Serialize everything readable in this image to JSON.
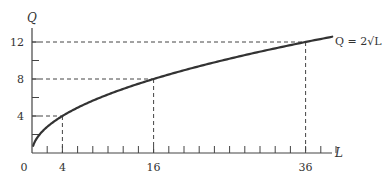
{
  "chart_data": {
    "type": "line",
    "title": "",
    "xlabel": "L",
    "ylabel": "Q",
    "series": [
      {
        "name": "Q = 2√L",
        "function": "Q = 2*sqrt(L)",
        "x": [
          0,
          1,
          2,
          4,
          8,
          12,
          16,
          20,
          24,
          28,
          32,
          36,
          40
        ],
        "values": [
          0,
          2,
          2.83,
          4,
          5.66,
          6.93,
          8,
          8.94,
          9.8,
          10.58,
          11.31,
          12,
          12.65
        ]
      }
    ],
    "highlighted_points": [
      {
        "L": 4,
        "Q": 4
      },
      {
        "L": 16,
        "Q": 8
      },
      {
        "L": 36,
        "Q": 12
      }
    ],
    "x_tick_labels": [
      "0",
      "4",
      "16",
      "36"
    ],
    "y_tick_labels": [
      "4",
      "8",
      "12"
    ],
    "x_minor_tick_step": 2,
    "y_minor_tick_step": 2,
    "xlim": [
      0,
      42
    ],
    "ylim": [
      0,
      13
    ],
    "grid": false,
    "legend": "inline label at curve end",
    "curve_label": "Q = 2√L",
    "colors": {
      "curve": "#333333",
      "axes": "#444444",
      "guides": "#444444"
    }
  }
}
